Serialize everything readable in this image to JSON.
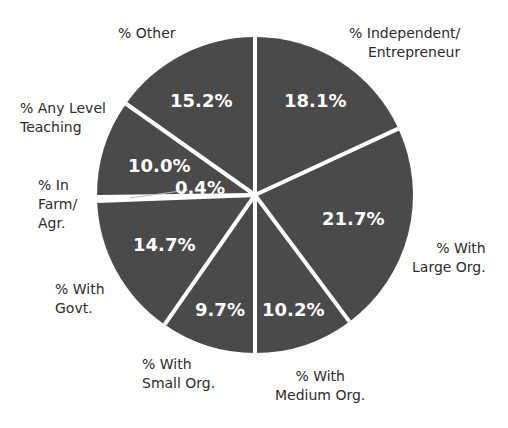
{
  "chart_data": {
    "type": "pie",
    "title": "",
    "start_angle": "12 o'clock, clockwise",
    "slice_color": "#4a4a4a",
    "separator_color": "#ffffff",
    "slices": [
      {
        "label": "% Independent/\nEntrepreneur",
        "value": 18.1,
        "display": "18.1%"
      },
      {
        "label": "% With\nLarge Org.",
        "value": 21.7,
        "display": "21.7%"
      },
      {
        "label": "% With\nMedium Org.",
        "value": 10.2,
        "display": "10.2%"
      },
      {
        "label": "% With\nSmall Org.",
        "value": 9.7,
        "display": "9.7%"
      },
      {
        "label": "% With\nGovt.",
        "value": 14.7,
        "display": "14.7%"
      },
      {
        "label": "% In\nFarm/\nAgr.",
        "value": 0.4,
        "display": "0.4%"
      },
      {
        "label": "% Any Level\nTeaching",
        "value": 10.0,
        "display": "10.0%"
      },
      {
        "label": "% Other",
        "value": 15.2,
        "display": "15.2%"
      }
    ]
  },
  "labels": {
    "independent": "% Independent/\nEntrepreneur",
    "large": "% With\nLarge Org.",
    "medium": "% With\nMedium Org.",
    "small": "% With\nSmall Org.",
    "govt": "% With\nGovt.",
    "farm": "% In\nFarm/\nAgr.",
    "teaching": "% Any Level\nTeaching",
    "other": "% Other"
  },
  "values": {
    "independent": "18.1%",
    "large": "21.7%",
    "medium": "10.2%",
    "small": "9.7%",
    "govt": "14.7%",
    "farm": "0.4%",
    "teaching": "10.0%",
    "other": "15.2%"
  }
}
